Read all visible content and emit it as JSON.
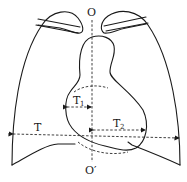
{
  "diagram": {
    "type": "cardiothoracic-ratio-schematic",
    "labels": {
      "top_axis": "O",
      "bottom_axis": "O′",
      "thoracic_width": "T",
      "left_heart_width_main": "T",
      "left_heart_width_sub": "1",
      "right_heart_width_main": "T",
      "right_heart_width_sub": "2"
    },
    "colors": {
      "line": "#1a1a1a",
      "background": "#ffffff"
    }
  }
}
